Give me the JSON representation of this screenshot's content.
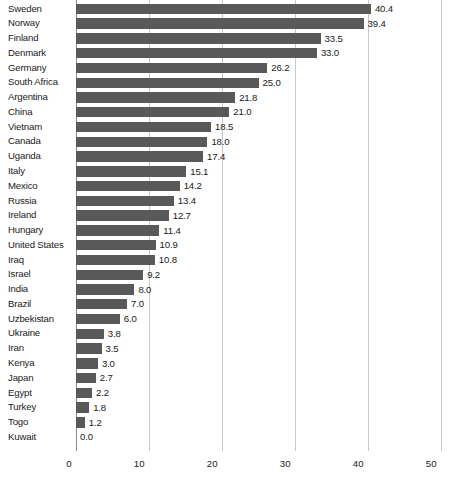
{
  "chart_data": {
    "type": "bar",
    "orientation": "horizontal",
    "title": "",
    "subtitle": "",
    "xlabel": "",
    "ylabel": "",
    "xlim": [
      0,
      50
    ],
    "xticks": [
      0,
      10,
      20,
      30,
      40,
      50
    ],
    "xtick_labels": [
      "0",
      "10",
      "20",
      "30",
      "40",
      "50"
    ],
    "grid": true,
    "grid_axis": "x",
    "legend": false,
    "bar_color": "#595959",
    "grid_color": "#c8c8c8",
    "axis_color": "#8a8a8a",
    "text_color": "#1a1a1a",
    "value_label_format": "one-decimal",
    "sorted": "descending",
    "categories": [
      "Sweden",
      "Norway",
      "Finland",
      "Denmark",
      "Germany",
      "South Africa",
      "Argentina",
      "China",
      "Vietnam",
      "Canada",
      "Uganda",
      "Italy",
      "Mexico",
      "Russia",
      "Ireland",
      "Hungary",
      "United States",
      "Iraq",
      "Israel",
      "India",
      "Brazil",
      "Uzbekistan",
      "Ukraine",
      "Iran",
      "Kenya",
      "Japan",
      "Egypt",
      "Turkey",
      "Togo",
      "Kuwait"
    ],
    "values": [
      40.4,
      39.4,
      33.5,
      33.0,
      26.2,
      25.0,
      21.8,
      21.0,
      18.5,
      18.0,
      17.4,
      15.1,
      14.2,
      13.4,
      12.7,
      11.4,
      10.9,
      10.8,
      9.2,
      8.0,
      7.0,
      6.0,
      3.8,
      3.5,
      3.0,
      2.7,
      2.2,
      1.8,
      1.2,
      0.0
    ],
    "value_labels": [
      "40.4",
      "39.4",
      "33.5",
      "33.0",
      "26.2",
      "25.0",
      "21.8",
      "21.0",
      "18.5",
      "18.0",
      "17.4",
      "15.1",
      "14.2",
      "13.4",
      "12.7",
      "11.4",
      "10.9",
      "10.8",
      "9.2",
      "8.0",
      "7.0",
      "6.0",
      "3.8",
      "3.5",
      "3.0",
      "2.7",
      "2.2",
      "1.8",
      "1.2",
      "0.0"
    ]
  }
}
